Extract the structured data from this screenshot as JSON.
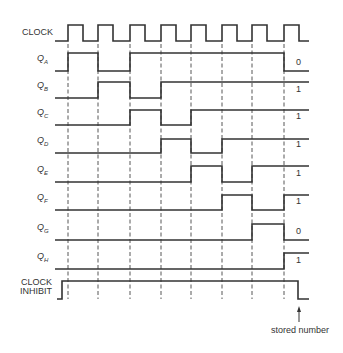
{
  "diagram": {
    "clock_label": "CLOCK",
    "clock_inhibit_label": [
      "CLOCK",
      "INHIBIT"
    ],
    "annotation": "stored number",
    "stroke_color": "#333333",
    "clock_rising_edges_x": [
      68,
      98,
      130,
      161,
      191,
      222,
      252,
      284
    ],
    "signals": [
      {
        "name": "Q",
        "sub": "A",
        "final_value": "0",
        "low_y": 71,
        "high_y": 53,
        "transitions": [
          {
            "x": 55,
            "level": 0
          },
          {
            "x": 68,
            "level": 1
          },
          {
            "x": 98,
            "level": 0
          },
          {
            "x": 130,
            "level": 1
          },
          {
            "x": 284,
            "level": 0
          },
          {
            "x": 309,
            "level": 0
          }
        ]
      },
      {
        "name": "Q",
        "sub": "B",
        "final_value": "1",
        "low_y": 98,
        "high_y": 82,
        "transitions": [
          {
            "x": 55,
            "level": 0
          },
          {
            "x": 98,
            "level": 1
          },
          {
            "x": 130,
            "level": 0
          },
          {
            "x": 161,
            "level": 1
          },
          {
            "x": 309,
            "level": 1
          }
        ]
      },
      {
        "name": "Q",
        "sub": "C",
        "final_value": "1",
        "low_y": 125,
        "high_y": 110,
        "transitions": [
          {
            "x": 55,
            "level": 0
          },
          {
            "x": 130,
            "level": 1
          },
          {
            "x": 161,
            "level": 0
          },
          {
            "x": 191,
            "level": 1
          },
          {
            "x": 309,
            "level": 1
          }
        ]
      },
      {
        "name": "Q",
        "sub": "D",
        "final_value": "1",
        "low_y": 153,
        "high_y": 139,
        "transitions": [
          {
            "x": 55,
            "level": 0
          },
          {
            "x": 161,
            "level": 1
          },
          {
            "x": 191,
            "level": 0
          },
          {
            "x": 222,
            "level": 1
          },
          {
            "x": 309,
            "level": 1
          }
        ]
      },
      {
        "name": "Q",
        "sub": "E",
        "final_value": "1",
        "low_y": 182,
        "high_y": 166,
        "transitions": [
          {
            "x": 55,
            "level": 0
          },
          {
            "x": 191,
            "level": 1
          },
          {
            "x": 222,
            "level": 0
          },
          {
            "x": 252,
            "level": 1
          },
          {
            "x": 309,
            "level": 1
          }
        ]
      },
      {
        "name": "Q",
        "sub": "F",
        "final_value": "1",
        "low_y": 210,
        "high_y": 195,
        "transitions": [
          {
            "x": 55,
            "level": 0
          },
          {
            "x": 222,
            "level": 1
          },
          {
            "x": 252,
            "level": 0
          },
          {
            "x": 284,
            "level": 1
          },
          {
            "x": 309,
            "level": 1
          }
        ]
      },
      {
        "name": "Q",
        "sub": "G",
        "final_value": "0",
        "low_y": 240,
        "high_y": 224,
        "transitions": [
          {
            "x": 55,
            "level": 0
          },
          {
            "x": 252,
            "level": 1
          },
          {
            "x": 284,
            "level": 0
          },
          {
            "x": 309,
            "level": 0
          }
        ]
      },
      {
        "name": "Q",
        "sub": "H",
        "final_value": "1",
        "low_y": 269,
        "high_y": 253,
        "transitions": [
          {
            "x": 55,
            "level": 0
          },
          {
            "x": 284,
            "level": 1
          },
          {
            "x": 309,
            "level": 1
          }
        ]
      }
    ],
    "clock": {
      "low_y": 41,
      "high_y": 25,
      "start_x": 55,
      "end_x": 309,
      "high_width": 15
    },
    "clock_inhibit": {
      "low_y": 299,
      "high_y": 281,
      "transitions": [
        {
          "x": 57,
          "level": 0
        },
        {
          "x": 62,
          "level": 1
        },
        {
          "x": 298,
          "level": 0
        },
        {
          "x": 309,
          "level": 0
        }
      ]
    },
    "grid": {
      "top_y": 44,
      "bottom_y": 299
    }
  }
}
